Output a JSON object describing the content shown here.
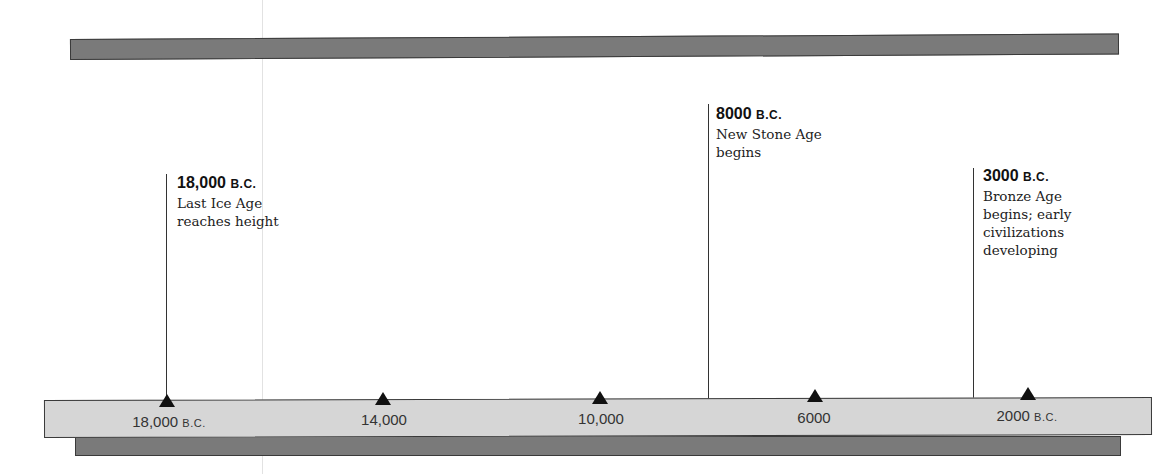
{
  "timeline": {
    "ticks": [
      {
        "num": "18,000",
        "suffix": "B.C.",
        "x": 167
      },
      {
        "num": "14,000",
        "suffix": "",
        "x": 383
      },
      {
        "num": "10,000",
        "suffix": "",
        "x": 600
      },
      {
        "num": "6000",
        "suffix": "",
        "x": 815
      },
      {
        "num": "2000",
        "suffix": "B.C.",
        "x": 1028
      }
    ],
    "events": [
      {
        "date_num": "18,000",
        "date_suffix": "B.C.",
        "desc": [
          "Last Ice Age",
          "reaches height"
        ]
      },
      {
        "date_num": "8000",
        "date_suffix": "B.C.",
        "desc": [
          "New Stone Age",
          "begins"
        ]
      },
      {
        "date_num": "3000",
        "date_suffix": "B.C.",
        "desc": [
          "Bronze Age",
          "begins; early",
          "civilizations",
          "developing"
        ]
      }
    ]
  }
}
